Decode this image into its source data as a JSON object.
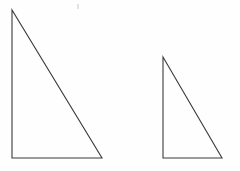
{
  "figure": {
    "background_color": "#fefefe",
    "canvas": {
      "width": 240,
      "height": 171
    },
    "stroke_color": "#3a3a3a",
    "stroke_width": 1.1,
    "fill": "none",
    "shapes": [
      {
        "name": "large-right-triangle",
        "label": "Large right triangle",
        "orientation": "right angle at bottom-left",
        "vertices": [
          {
            "label": "apex",
            "x": 12,
            "y": 10
          },
          {
            "label": "bottom-left",
            "x": 12,
            "y": 158
          },
          {
            "label": "bottom-right",
            "x": 102,
            "y": 158
          }
        ],
        "points_attr": "12,10 12,158 102,158",
        "leg_vertical": 148,
        "leg_horizontal": 90,
        "stroke_color": "#3a3a3a"
      },
      {
        "name": "small-right-triangle",
        "label": "Small right triangle",
        "orientation": "right angle at bottom-left",
        "vertices": [
          {
            "label": "apex",
            "x": 163,
            "y": 57
          },
          {
            "label": "bottom-left",
            "x": 163,
            "y": 158
          },
          {
            "label": "bottom-right",
            "x": 222,
            "y": 158
          }
        ],
        "points_attr": "163,57 163,158 222,158",
        "leg_vertical": 101,
        "leg_horizontal": 59,
        "stroke_color": "#3a3a3a"
      }
    ],
    "artifacts": [
      {
        "name": "scan-speck",
        "label": "faint scan speck",
        "x": 77,
        "y": 4,
        "color": "#d8d8d8"
      }
    ]
  }
}
